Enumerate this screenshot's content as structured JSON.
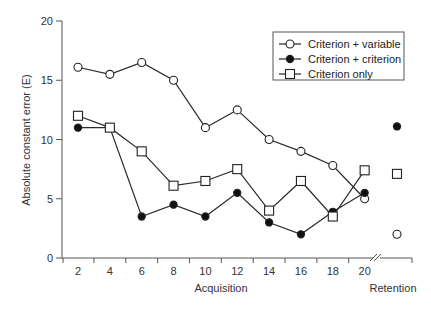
{
  "chart_data": {
    "type": "line",
    "title": "",
    "xlabel": "Acquisition",
    "xlabel_secondary": "Retention",
    "ylabel": "Absolute constant error (E)",
    "ylim": [
      0,
      20
    ],
    "yticks": [
      0,
      5,
      10,
      15,
      20
    ],
    "x": [
      2,
      4,
      6,
      8,
      10,
      12,
      14,
      16,
      18,
      20
    ],
    "xticks": [
      "2",
      "4",
      "6",
      "8",
      "10",
      "12",
      "14",
      "16",
      "18",
      "20"
    ],
    "grid": false,
    "legend_position": "top-right",
    "series": [
      {
        "name": "Criterion + variable",
        "marker": "open-circle",
        "values": [
          16.1,
          15.5,
          16.5,
          15.0,
          11.0,
          12.5,
          10.0,
          9.0,
          7.8,
          5.0
        ],
        "retention": 2.0
      },
      {
        "name": "Criterion + criterion",
        "marker": "filled-circle",
        "values": [
          11.0,
          11.0,
          3.5,
          4.5,
          3.5,
          5.5,
          3.0,
          2.0,
          3.9,
          5.5
        ],
        "retention": 11.1
      },
      {
        "name": "Criterion only",
        "marker": "open-square",
        "values": [
          12.0,
          11.0,
          9.0,
          6.1,
          6.5,
          7.5,
          4.0,
          6.5,
          3.5,
          7.4
        ],
        "retention": 7.1
      }
    ]
  }
}
